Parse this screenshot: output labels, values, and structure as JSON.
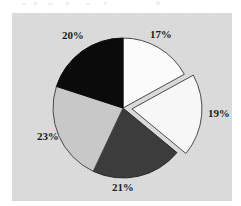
{
  "figure": {
    "background_color": "#ffffff",
    "panel_color": "#dcdcdc",
    "panel_border_color": "#b4b4b4"
  },
  "chart_data": {
    "type": "pie",
    "title": "",
    "subtitle": "",
    "xlabel": "",
    "ylabel": "",
    "grid": false,
    "legend": "none",
    "start_angle_deg": 0,
    "direction": "clockwise",
    "units": "percent",
    "total": 100,
    "categories": [
      "17%",
      "19%",
      "21%",
      "23%",
      "20%"
    ],
    "values": [
      17,
      19,
      21,
      23,
      20
    ],
    "labels": [
      "17%",
      "19%",
      "21%",
      "23%",
      "20%"
    ],
    "slices": [
      {
        "label": "17%",
        "value": 17,
        "fill": "#fbfbfb",
        "edge": "#4a4a4a",
        "exploded": false,
        "offset": 0,
        "start_angle_deg": 0,
        "end_angle_deg": 61.2,
        "label_x": 150,
        "label_y": 29
      },
      {
        "label": "19%",
        "value": 19,
        "fill": "#f7f7f7",
        "edge": "#4a4a4a",
        "exploded": true,
        "offset": 9,
        "start_angle_deg": 61.2,
        "end_angle_deg": 129.6,
        "label_x": 208,
        "label_y": 108
      },
      {
        "label": "21%",
        "value": 21,
        "fill": "#3c3c3c",
        "edge": "#2a2a2a",
        "exploded": false,
        "offset": 0,
        "start_angle_deg": 129.6,
        "end_angle_deg": 205.2,
        "label_x": 112,
        "label_y": 182
      },
      {
        "label": "23%",
        "value": 23,
        "fill": "#c8c8c8",
        "edge": "#4a4a4a",
        "exploded": false,
        "offset": 0,
        "start_angle_deg": 205.2,
        "end_angle_deg": 288.0,
        "label_x": 37,
        "label_y": 131
      },
      {
        "label": "20%",
        "value": 20,
        "fill": "#0b0b0b",
        "edge": "#0b0b0b",
        "exploded": false,
        "offset": 0,
        "start_angle_deg": 288.0,
        "end_angle_deg": 360.0,
        "label_x": 62,
        "label_y": 30
      }
    ],
    "geometry": {
      "center_x": 123,
      "center_y": 108,
      "radius": 70
    }
  }
}
